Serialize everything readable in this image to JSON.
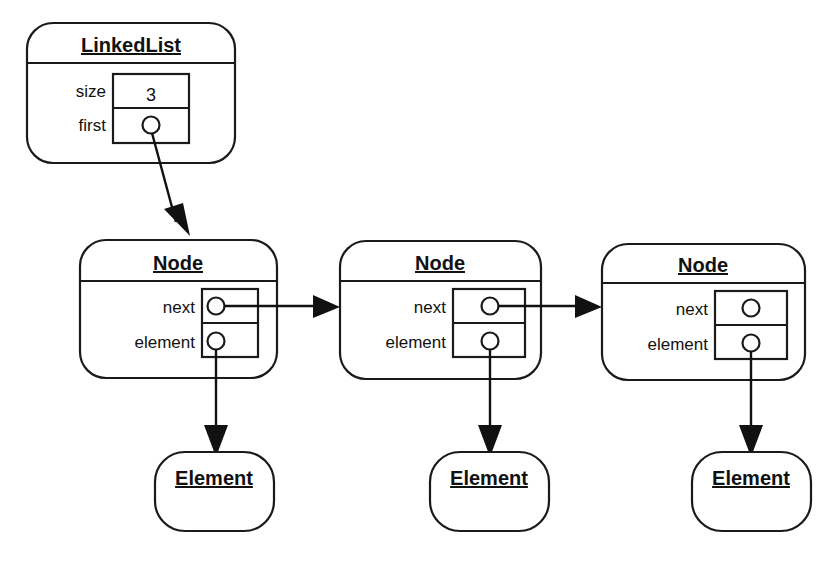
{
  "diagram": {
    "kind": "object-reference-diagram",
    "subject": "LinkedList",
    "background_color": "#ffffff",
    "line_color": "#111111"
  },
  "linked_list": {
    "title": "LinkedList",
    "fields": [
      {
        "label": "size",
        "value": "3",
        "kind": "value"
      },
      {
        "label": "first",
        "value": "",
        "kind": "reference"
      }
    ]
  },
  "nodes": [
    {
      "title": "Node",
      "fields": [
        {
          "label": "next",
          "kind": "reference"
        },
        {
          "label": "element",
          "kind": "reference"
        }
      ]
    },
    {
      "title": "Node",
      "fields": [
        {
          "label": "next",
          "kind": "reference"
        },
        {
          "label": "element",
          "kind": "reference"
        }
      ]
    },
    {
      "title": "Node",
      "fields": [
        {
          "label": "next",
          "kind": "reference"
        },
        {
          "label": "element",
          "kind": "reference"
        }
      ]
    }
  ],
  "elements": [
    {
      "title": "Element"
    },
    {
      "title": "Element"
    },
    {
      "title": "Element"
    }
  ],
  "arrows": [
    {
      "name": "first-to-node1",
      "from": "linkedlist.first",
      "to": "node1"
    },
    {
      "name": "node1-next-to-node2",
      "from": "node1.next",
      "to": "node2"
    },
    {
      "name": "node2-next-to-node3",
      "from": "node2.next",
      "to": "node3"
    },
    {
      "name": "node1-element-to-element1",
      "from": "node1.element",
      "to": "element1"
    },
    {
      "name": "node2-element-to-element2",
      "from": "node2.element",
      "to": "element2"
    },
    {
      "name": "node3-element-to-element3",
      "from": "node3.element",
      "to": "element3"
    }
  ]
}
